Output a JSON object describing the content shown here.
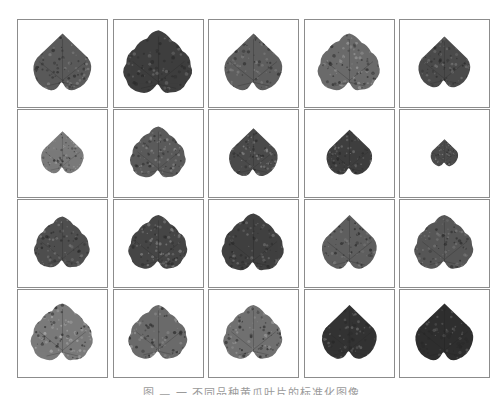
{
  "figure": {
    "rows": 4,
    "columns": 5,
    "tile_border_color": "#8c8c8c",
    "tiles": [
      {
        "row": 1,
        "col": 1,
        "subject": "leaf",
        "tone": "#5a5a5a",
        "scale": 0.95,
        "speckle": "#8a8a8a",
        "shape": "heart"
      },
      {
        "row": 1,
        "col": 2,
        "subject": "leaf",
        "tone": "#3e3e3e",
        "scale": 1.05,
        "speckle": "#6a6a6a",
        "shape": "lobed"
      },
      {
        "row": 1,
        "col": 3,
        "subject": "leaf",
        "tone": "#5e5e5e",
        "scale": 0.95,
        "speckle": "#7e7e7e",
        "shape": "heart"
      },
      {
        "row": 1,
        "col": 4,
        "subject": "leaf",
        "tone": "#6a6a6a",
        "scale": 0.95,
        "speckle": "#9a9a9a",
        "shape": "lobed"
      },
      {
        "row": 1,
        "col": 5,
        "subject": "leaf",
        "tone": "#4a4a4a",
        "scale": 0.85,
        "speckle": "#7a7a7a",
        "shape": "heart"
      },
      {
        "row": 2,
        "col": 1,
        "subject": "leaf",
        "tone": "#7a7a7a",
        "scale": 0.7,
        "speckle": "#a0a0a0",
        "shape": "heart"
      },
      {
        "row": 2,
        "col": 2,
        "subject": "leaf",
        "tone": "#5a5a5a",
        "scale": 0.85,
        "speckle": "#8e8e8e",
        "shape": "lobed"
      },
      {
        "row": 2,
        "col": 3,
        "subject": "leaf",
        "tone": "#4a4a4a",
        "scale": 0.8,
        "speckle": "#8a8a8a",
        "shape": "heart"
      },
      {
        "row": 2,
        "col": 4,
        "subject": "leaf",
        "tone": "#3e3e3e",
        "scale": 0.75,
        "speckle": "#7a7a7a",
        "shape": "heart"
      },
      {
        "row": 2,
        "col": 5,
        "subject": "leaf",
        "tone": "#4a4a4a",
        "scale": 0.45,
        "speckle": "#8a8a8a",
        "shape": "heart"
      },
      {
        "row": 3,
        "col": 1,
        "subject": "leaf",
        "tone": "#4e4e4e",
        "scale": 0.85,
        "speckle": "#7e7e7e",
        "shape": "lobed"
      },
      {
        "row": 3,
        "col": 2,
        "subject": "leaf",
        "tone": "#454545",
        "scale": 0.9,
        "speckle": "#858585",
        "shape": "lobed"
      },
      {
        "row": 3,
        "col": 3,
        "subject": "leaf",
        "tone": "#404040",
        "scale": 0.95,
        "speckle": "#707070",
        "shape": "lobed"
      },
      {
        "row": 3,
        "col": 4,
        "subject": "leaf",
        "tone": "#5e5e5e",
        "scale": 0.9,
        "speckle": "#7e7e7e",
        "shape": "heart"
      },
      {
        "row": 3,
        "col": 5,
        "subject": "leaf",
        "tone": "#565656",
        "scale": 0.9,
        "speckle": "#7a7a7a",
        "shape": "lobed"
      },
      {
        "row": 4,
        "col": 1,
        "subject": "leaf",
        "tone": "#7a7a7a",
        "scale": 0.95,
        "speckle": "#a8a8a8",
        "shape": "lobed"
      },
      {
        "row": 4,
        "col": 2,
        "subject": "leaf",
        "tone": "#6a6a6a",
        "scale": 0.9,
        "speckle": "#959595",
        "shape": "lobed"
      },
      {
        "row": 4,
        "col": 3,
        "subject": "leaf",
        "tone": "#707070",
        "scale": 0.9,
        "speckle": "#9a9a9a",
        "shape": "lobed"
      },
      {
        "row": 4,
        "col": 4,
        "subject": "leaf",
        "tone": "#333333",
        "scale": 0.9,
        "speckle": "#6a6a6a",
        "shape": "heart"
      },
      {
        "row": 4,
        "col": 5,
        "subject": "leaf",
        "tone": "#2e2e2e",
        "scale": 0.95,
        "speckle": "#626262",
        "shape": "heart"
      }
    ]
  },
  "caption": {
    "text": "图 — 一 不同品种黄瓜叶片的标准化图像"
  }
}
